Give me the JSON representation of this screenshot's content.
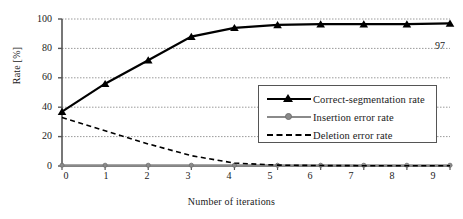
{
  "chart_data": {
    "type": "line",
    "title": "",
    "xlabel": "Number of iterations",
    "ylabel": "Rate [%]",
    "x": [
      0,
      1,
      2,
      3,
      4,
      5,
      6,
      7,
      8,
      9
    ],
    "xticks": [
      "0",
      "1",
      "2",
      "3",
      "4",
      "5",
      "6",
      "7",
      "8",
      "9"
    ],
    "yticks": [
      "0",
      "20",
      "40",
      "60",
      "80",
      "100"
    ],
    "xlim": [
      0,
      9
    ],
    "ylim": [
      0,
      100
    ],
    "grid": "horizontal-dotted",
    "legend_position": "inside-lower-right",
    "series": [
      {
        "name": "Correct-segmentation rate",
        "values": [
          37,
          56,
          72,
          88,
          94,
          96,
          96.5,
          96.5,
          96.5,
          97
        ],
        "color": "#000000",
        "style": "solid",
        "marker": "triangle"
      },
      {
        "name": "Insertion error rate",
        "values": [
          0.5,
          0.5,
          0.5,
          0.5,
          0.5,
          0.5,
          0.5,
          0.5,
          0.5,
          0.5
        ],
        "color": "#8a8a8a",
        "style": "solid",
        "marker": "circle"
      },
      {
        "name": "Deletion error rate",
        "values": [
          33,
          24,
          15,
          7,
          2,
          0.6,
          0.3,
          0.2,
          0.2,
          0.2
        ],
        "color": "#000000",
        "style": "dashed",
        "marker": "none"
      }
    ],
    "annotations": [
      {
        "text": "97",
        "x": 9,
        "y": 85
      }
    ]
  },
  "legend": {
    "items": [
      {
        "label": "Correct-segmentation rate"
      },
      {
        "label": "Insertion error rate"
      },
      {
        "label": "Deletion error rate"
      }
    ]
  }
}
